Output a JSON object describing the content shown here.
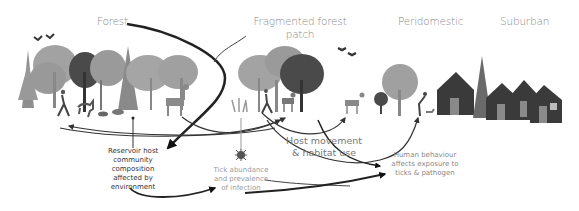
{
  "zones": [
    {
      "id": "forest",
      "label": "Forest"
    },
    {
      "id": "fragmented",
      "label_line1": "Fragmented forest",
      "label_line2": "patch"
    },
    {
      "id": "peridomestic",
      "label": "Peridomestic"
    },
    {
      "id": "suburban",
      "label": "Suburban"
    }
  ],
  "annotations": {
    "reservoir": [
      "Reservoir host",
      "community",
      "composition",
      "affected by",
      "environment"
    ],
    "tick": [
      "Tick abundance",
      "and prevalence",
      "of infection"
    ],
    "host_movement": [
      "Host movement",
      "& habitat use"
    ],
    "human": [
      "Human behaviour",
      "affects exposure to",
      "ticks & pathogen"
    ]
  },
  "icons": [
    "bird-icon",
    "deer-icon",
    "human-walker-icon",
    "tick-icon",
    "house-icon",
    "tree-icon",
    "dog-icon",
    "rodent-icon"
  ],
  "colors": {
    "tree_light": "#9d9d9d",
    "tree_mid": "#7c7c7c",
    "tree_dark": "#3f3f3f",
    "house": "#3a3a3a",
    "door": "#8a8a8a",
    "arrow": "#1e1e1e",
    "label": "#8a8a8a"
  }
}
